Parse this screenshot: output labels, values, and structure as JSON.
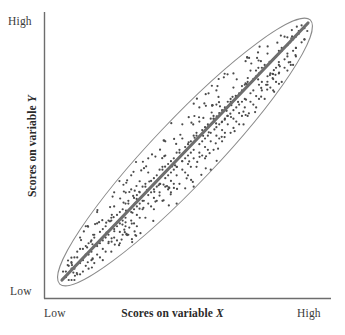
{
  "figure": {
    "axes": {
      "x_axis_title_prefix": "Scores on variable ",
      "x_axis_variable": "X",
      "y_axis_title_prefix": "Scores on variable ",
      "y_axis_variable": "Y",
      "x_low_label": "Low",
      "x_high_label": "High",
      "y_low_label": "Low",
      "y_high_label": "High"
    },
    "colors": {
      "axis_line": "#6d6d6d",
      "ellipse_stroke": "#8a8a8a",
      "trend_line": "#6e6e6e",
      "dot": "#4a4a4a",
      "label_text": "#3a3a3a",
      "title_text": "#2a2a2a",
      "background": "#ffffff"
    }
  },
  "chart_data": {
    "type": "scatter",
    "title": "",
    "subtitle": "",
    "xlabel": "Scores on variable X",
    "ylabel": "Scores on variable Y",
    "xlim": [
      0,
      100
    ],
    "ylim": [
      0,
      100
    ],
    "xtick_labels": [
      "Low",
      "High"
    ],
    "ytick_labels": [
      "Low",
      "High"
    ],
    "grid": false,
    "legend": null,
    "annotations": [
      {
        "name": "correlation-ellipse",
        "shape": "ellipse",
        "center_x": 50,
        "center_y": 50,
        "semi_major": 62,
        "semi_minor": 11,
        "rotation_deg": -46,
        "description": "Narrow tilted envelope indicating strong positive correlation"
      },
      {
        "name": "trend-line",
        "shape": "line",
        "x0": 5,
        "y0": 4,
        "x1": 95,
        "y1": 96,
        "description": "Best-fit line of strong positive linear relationship"
      }
    ],
    "relationship": "strong positive correlation",
    "n_points": 300,
    "points": [
      [
        6,
        5
      ],
      [
        8,
        3
      ],
      [
        7,
        9
      ],
      [
        10,
        6
      ],
      [
        9,
        12
      ],
      [
        12,
        8
      ],
      [
        11,
        14
      ],
      [
        14,
        11
      ],
      [
        13,
        17
      ],
      [
        16,
        13
      ],
      [
        15,
        19
      ],
      [
        18,
        15
      ],
      [
        17,
        21
      ],
      [
        20,
        17
      ],
      [
        19,
        23
      ],
      [
        22,
        19
      ],
      [
        21,
        25
      ],
      [
        24,
        21
      ],
      [
        23,
        27
      ],
      [
        26,
        23
      ],
      [
        25,
        29
      ],
      [
        28,
        25
      ],
      [
        27,
        31
      ],
      [
        30,
        27
      ],
      [
        29,
        33
      ],
      [
        32,
        29
      ],
      [
        31,
        35
      ],
      [
        34,
        31
      ],
      [
        33,
        37
      ],
      [
        36,
        33
      ],
      [
        35,
        39
      ],
      [
        38,
        35
      ],
      [
        37,
        41
      ],
      [
        40,
        37
      ],
      [
        39,
        43
      ],
      [
        42,
        39
      ],
      [
        41,
        45
      ],
      [
        44,
        41
      ],
      [
        43,
        47
      ],
      [
        46,
        43
      ],
      [
        45,
        49
      ],
      [
        48,
        45
      ],
      [
        47,
        51
      ],
      [
        50,
        47
      ],
      [
        49,
        53
      ],
      [
        52,
        49
      ],
      [
        51,
        55
      ],
      [
        54,
        51
      ],
      [
        53,
        57
      ],
      [
        56,
        53
      ],
      [
        55,
        59
      ],
      [
        58,
        55
      ],
      [
        57,
        61
      ],
      [
        60,
        57
      ],
      [
        59,
        63
      ],
      [
        62,
        59
      ],
      [
        61,
        65
      ],
      [
        64,
        61
      ],
      [
        63,
        67
      ],
      [
        66,
        63
      ],
      [
        65,
        69
      ],
      [
        68,
        65
      ],
      [
        67,
        71
      ],
      [
        70,
        67
      ],
      [
        69,
        73
      ],
      [
        72,
        69
      ],
      [
        71,
        75
      ],
      [
        74,
        71
      ],
      [
        73,
        77
      ],
      [
        76,
        73
      ],
      [
        75,
        79
      ],
      [
        78,
        75
      ],
      [
        77,
        81
      ],
      [
        80,
        77
      ],
      [
        79,
        83
      ],
      [
        82,
        79
      ],
      [
        81,
        85
      ],
      [
        84,
        81
      ],
      [
        83,
        87
      ],
      [
        86,
        83
      ],
      [
        85,
        89
      ],
      [
        88,
        85
      ],
      [
        87,
        91
      ],
      [
        90,
        87
      ],
      [
        89,
        93
      ],
      [
        92,
        89
      ],
      [
        91,
        95
      ],
      [
        94,
        91
      ],
      [
        93,
        96
      ],
      [
        95,
        94
      ],
      [
        7,
        7
      ],
      [
        9,
        10
      ],
      [
        12,
        12
      ],
      [
        15,
        15
      ],
      [
        18,
        18
      ],
      [
        21,
        21
      ],
      [
        24,
        24
      ],
      [
        27,
        27
      ],
      [
        30,
        30
      ],
      [
        33,
        33
      ],
      [
        36,
        36
      ],
      [
        39,
        39
      ],
      [
        42,
        42
      ],
      [
        45,
        45
      ],
      [
        48,
        48
      ],
      [
        51,
        51
      ],
      [
        54,
        54
      ],
      [
        57,
        57
      ],
      [
        60,
        60
      ],
      [
        63,
        63
      ],
      [
        66,
        66
      ],
      [
        69,
        69
      ],
      [
        72,
        72
      ],
      [
        75,
        75
      ],
      [
        78,
        78
      ],
      [
        81,
        81
      ],
      [
        84,
        84
      ],
      [
        87,
        87
      ],
      [
        90,
        90
      ],
      [
        93,
        93
      ],
      [
        10,
        14
      ],
      [
        13,
        9
      ],
      [
        16,
        20
      ],
      [
        19,
        14
      ],
      [
        22,
        27
      ],
      [
        25,
        20
      ],
      [
        28,
        33
      ],
      [
        31,
        26
      ],
      [
        34,
        39
      ],
      [
        37,
        32
      ],
      [
        40,
        45
      ],
      [
        43,
        38
      ],
      [
        46,
        51
      ],
      [
        49,
        44
      ],
      [
        52,
        57
      ],
      [
        55,
        50
      ],
      [
        58,
        63
      ],
      [
        61,
        56
      ],
      [
        64,
        69
      ],
      [
        67,
        62
      ],
      [
        70,
        75
      ],
      [
        73,
        68
      ],
      [
        76,
        81
      ],
      [
        79,
        74
      ],
      [
        82,
        87
      ],
      [
        85,
        80
      ],
      [
        88,
        92
      ],
      [
        91,
        86
      ],
      [
        94,
        95
      ],
      [
        92,
        84
      ],
      [
        11,
        8
      ],
      [
        14,
        18
      ],
      [
        17,
        12
      ],
      [
        20,
        24
      ],
      [
        23,
        16
      ],
      [
        26,
        30
      ],
      [
        29,
        22
      ],
      [
        32,
        36
      ],
      [
        35,
        28
      ],
      [
        38,
        42
      ],
      [
        41,
        34
      ],
      [
        44,
        48
      ],
      [
        47,
        40
      ],
      [
        50,
        54
      ],
      [
        53,
        46
      ],
      [
        56,
        60
      ],
      [
        59,
        52
      ],
      [
        62,
        66
      ],
      [
        65,
        58
      ],
      [
        68,
        72
      ],
      [
        71,
        64
      ],
      [
        74,
        78
      ],
      [
        77,
        70
      ],
      [
        80,
        84
      ],
      [
        83,
        76
      ],
      [
        86,
        90
      ],
      [
        89,
        82
      ],
      [
        92,
        94
      ],
      [
        90,
        80
      ],
      [
        87,
        78
      ],
      [
        8,
        11
      ],
      [
        11,
        16
      ],
      [
        14,
        7
      ],
      [
        17,
        22
      ],
      [
        20,
        13
      ],
      [
        23,
        28
      ],
      [
        26,
        19
      ],
      [
        29,
        34
      ],
      [
        32,
        25
      ],
      [
        35,
        40
      ],
      [
        38,
        31
      ],
      [
        41,
        46
      ],
      [
        44,
        37
      ],
      [
        47,
        52
      ],
      [
        50,
        43
      ],
      [
        53,
        58
      ],
      [
        56,
        49
      ],
      [
        59,
        64
      ],
      [
        62,
        55
      ],
      [
        65,
        70
      ],
      [
        68,
        61
      ],
      [
        71,
        76
      ],
      [
        74,
        67
      ],
      [
        77,
        82
      ],
      [
        80,
        73
      ],
      [
        83,
        88
      ],
      [
        86,
        79
      ],
      [
        89,
        94
      ],
      [
        85,
        86
      ],
      [
        82,
        83
      ],
      [
        9,
        6
      ],
      [
        12,
        17
      ],
      [
        15,
        10
      ],
      [
        18,
        26
      ],
      [
        21,
        16
      ],
      [
        24,
        32
      ],
      [
        27,
        22
      ],
      [
        30,
        38
      ],
      [
        33,
        28
      ],
      [
        36,
        44
      ],
      [
        39,
        34
      ],
      [
        42,
        50
      ],
      [
        45,
        40
      ],
      [
        48,
        56
      ],
      [
        51,
        46
      ],
      [
        54,
        62
      ],
      [
        57,
        52
      ],
      [
        60,
        68
      ],
      [
        63,
        58
      ],
      [
        66,
        74
      ],
      [
        69,
        64
      ],
      [
        72,
        80
      ],
      [
        75,
        70
      ],
      [
        78,
        86
      ],
      [
        81,
        76
      ],
      [
        84,
        92
      ],
      [
        87,
        82
      ],
      [
        90,
        96
      ],
      [
        88,
        88
      ],
      [
        91,
        91
      ],
      [
        13,
        13
      ],
      [
        16,
        16
      ],
      [
        19,
        19
      ],
      [
        22,
        22
      ],
      [
        25,
        25
      ],
      [
        28,
        28
      ],
      [
        31,
        31
      ],
      [
        34,
        34
      ],
      [
        37,
        37
      ],
      [
        40,
        40
      ],
      [
        43,
        43
      ],
      [
        46,
        46
      ],
      [
        49,
        49
      ],
      [
        52,
        52
      ],
      [
        55,
        55
      ],
      [
        58,
        58
      ],
      [
        61,
        61
      ],
      [
        64,
        64
      ],
      [
        67,
        67
      ],
      [
        70,
        70
      ],
      [
        73,
        73
      ],
      [
        76,
        76
      ],
      [
        79,
        79
      ],
      [
        82,
        82
      ],
      [
        85,
        85
      ],
      [
        88,
        88
      ],
      [
        91,
        91
      ],
      [
        94,
        94
      ],
      [
        6,
        9
      ],
      [
        8,
        6
      ],
      [
        10,
        10
      ],
      [
        12,
        21
      ],
      [
        14,
        15
      ],
      [
        16,
        8
      ],
      [
        18,
        30
      ],
      [
        20,
        20
      ],
      [
        22,
        11
      ],
      [
        24,
        37
      ],
      [
        26,
        26
      ],
      [
        28,
        16
      ],
      [
        30,
        43
      ],
      [
        32,
        32
      ],
      [
        34,
        21
      ],
      [
        36,
        49
      ],
      [
        38,
        38
      ],
      [
        40,
        27
      ],
      [
        42,
        55
      ],
      [
        44,
        44
      ],
      [
        46,
        33
      ],
      [
        48,
        61
      ],
      [
        50,
        50
      ],
      [
        52,
        39
      ],
      [
        54,
        67
      ],
      [
        56,
        56
      ],
      [
        58,
        45
      ],
      [
        60,
        73
      ],
      [
        62,
        62
      ],
      [
        64,
        51
      ],
      [
        66,
        79
      ],
      [
        68,
        68
      ]
    ]
  }
}
